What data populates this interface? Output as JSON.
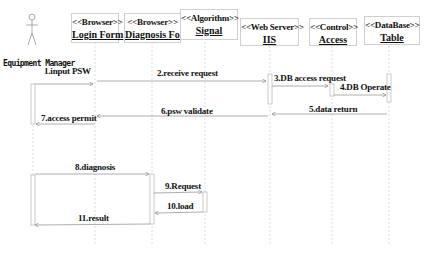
{
  "diagram": {
    "type": "uml-sequence",
    "actor": {
      "label": "Equipment Manager"
    },
    "objects": [
      {
        "id": "login",
        "stereotype": "<<Browser>>",
        "name": "Login Form"
      },
      {
        "id": "diag",
        "stereotype": "<<Browser>>",
        "name": "Diagnosis Form"
      },
      {
        "id": "signal",
        "stereotype": "<<Algorithm>>",
        "name": "Signal"
      },
      {
        "id": "iis",
        "stereotype": "<<Web Server>>",
        "name": "IIS"
      },
      {
        "id": "access",
        "stereotype": "<<Control>>",
        "name": "Access"
      },
      {
        "id": "table",
        "stereotype": "<<DataBase>>",
        "name": "Table"
      }
    ],
    "messages": [
      {
        "n": 1,
        "label": "1.input PSW",
        "from": "actor",
        "to": "login"
      },
      {
        "n": 2,
        "label": "2.receive request",
        "from": "login",
        "to": "iis"
      },
      {
        "n": 3,
        "label": "3.DB access request",
        "from": "iis",
        "to": "access"
      },
      {
        "n": 4,
        "label": "4.DB Operate",
        "from": "access",
        "to": "table"
      },
      {
        "n": 5,
        "label": "5.data return",
        "from": "table",
        "to": "iis"
      },
      {
        "n": 6,
        "label": "6.psw validate",
        "from": "iis",
        "to": "login"
      },
      {
        "n": 7,
        "label": "7.access permit",
        "from": "login",
        "to": "actor"
      },
      {
        "n": 8,
        "label": "8.diagnosis",
        "from": "actor",
        "to": "diag"
      },
      {
        "n": 9,
        "label": "9.Request",
        "from": "diag",
        "to": "signal"
      },
      {
        "n": 10,
        "label": "10.load",
        "from": "signal",
        "to": "diag"
      },
      {
        "n": 11,
        "label": "11.result",
        "from": "diag",
        "to": "actor"
      }
    ]
  }
}
